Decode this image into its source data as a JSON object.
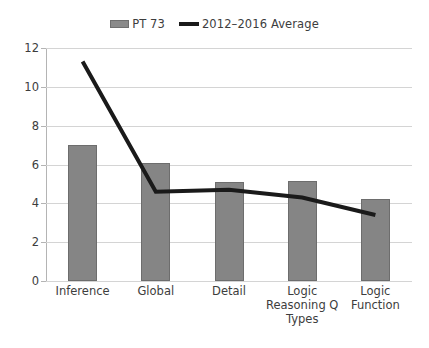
{
  "chart_data": {
    "type": "bar",
    "title": "",
    "subtitle": "",
    "xlabel": "",
    "ylabel": "",
    "categories": [
      "Inference",
      "Global",
      "Detail",
      "Logic Reasoning Q Types",
      "Logic Function"
    ],
    "category_lines": [
      [
        "Inference"
      ],
      [
        "Global"
      ],
      [
        "Detail"
      ],
      [
        "Logic",
        "Reasoning Q",
        "Types"
      ],
      [
        "Logic",
        "Function"
      ]
    ],
    "series": [
      {
        "name": "PT 73",
        "type": "bar",
        "color": "#858585",
        "values": [
          7,
          6.1,
          5.1,
          5.15,
          4.2
        ]
      },
      {
        "name": "2012–2016 Average",
        "type": "line",
        "color": "#1a1a1a",
        "values": [
          11.3,
          4.6,
          4.7,
          4.3,
          3.4
        ]
      }
    ],
    "ylim": [
      0,
      12
    ],
    "ytick_step": 2,
    "yticks": [
      0,
      2,
      4,
      6,
      8,
      10,
      12
    ],
    "ytick_labels": [
      "0",
      "2",
      "4",
      "6",
      "8",
      "10",
      "12"
    ],
    "grid": true,
    "grid_axis": "y",
    "legend_position": "top-center",
    "background_color": "#ffffff"
  },
  "legend": {
    "entries": [
      {
        "label": "PT 73",
        "swatch": "bar-swatch-icon"
      },
      {
        "label": "2012–2016 Average",
        "swatch": "line-swatch-icon"
      }
    ]
  }
}
